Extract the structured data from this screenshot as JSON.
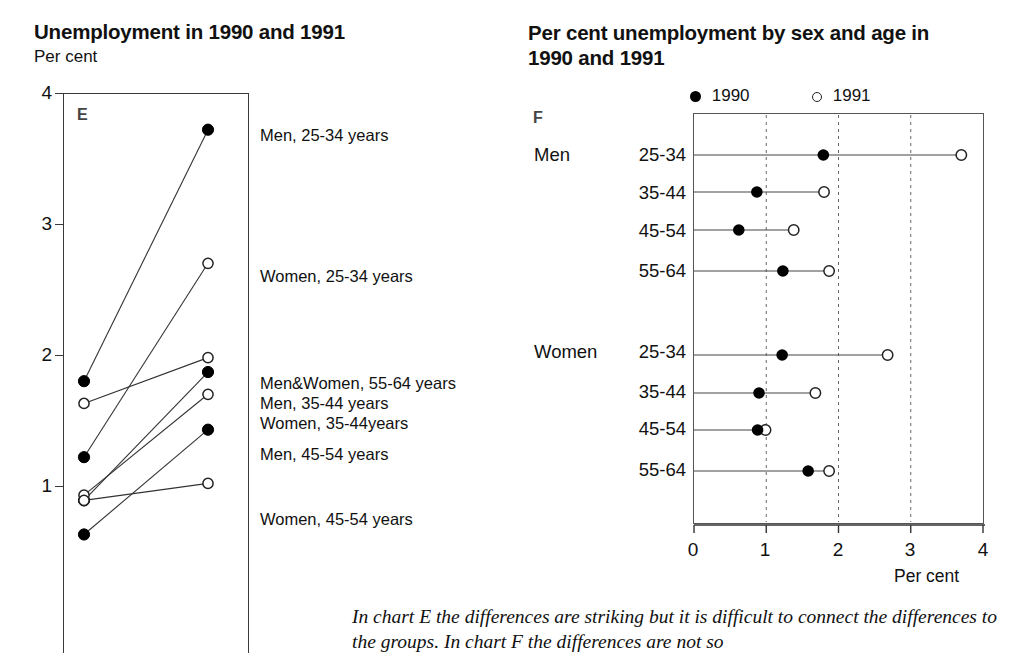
{
  "chart_e": {
    "title": "Unemployment in 1990 and 1991",
    "unit_label": "Per cent",
    "panel_letter": "E",
    "y_ticks": [
      "4",
      "3",
      "2",
      "1"
    ],
    "legend": [
      "Men, 25-34 years",
      "Women, 25-34 years",
      "Men&Women, 55-64 years",
      "Men, 35-44 years",
      "Women, 35-44years",
      "Men, 45-54 years",
      "Women, 45-54 years"
    ]
  },
  "chart_f": {
    "title": "Per cent unemployment by sex and age in 1990 and 1991",
    "panel_letter": "F",
    "legend": [
      {
        "marker": "filled-dot-icon",
        "label": "1990"
      },
      {
        "marker": "open-dot-icon",
        "label": "1991"
      }
    ],
    "group_labels": [
      "Men",
      "Women"
    ],
    "row_labels": [
      "25-34",
      "35-44",
      "45-54",
      "55-64",
      "25-34",
      "35-44",
      "45-54",
      "55-64"
    ],
    "x_ticks": [
      "0",
      "1",
      "2",
      "3",
      "4"
    ],
    "x_axis_title": "Per cent"
  },
  "caption": {
    "text": "In chart E the differences are striking but it is difficult to connect the differences to the groups. In chart F the differences are not so"
  },
  "colors": {
    "ink": "#111111",
    "axis": "#3a3a3a",
    "grid": "#7a7a7a",
    "marker_fill": "#000000",
    "marker_open": "#ffffff"
  },
  "chart_data": [
    {
      "type": "line",
      "id": "chart-e",
      "title": "Unemployment in 1990 and 1991",
      "xlabel": "",
      "ylabel": "Per cent",
      "ylim": [
        0,
        4
      ],
      "yticks": [
        1,
        2,
        3,
        4
      ],
      "grid": false,
      "legend_position": "right-labels",
      "x": [
        "1990",
        "1991"
      ],
      "series": [
        {
          "name": "Men, 25-34 years",
          "values": [
            1.8,
            3.72
          ]
        },
        {
          "name": "Women, 25-34 years",
          "values": [
            1.22,
            2.7
          ]
        },
        {
          "name": "Men&Women, 55-64 years",
          "values": [
            1.63,
            1.98
          ]
        },
        {
          "name": "Men, 35-44 years",
          "values": [
            0.89,
            1.87
          ]
        },
        {
          "name": "Women, 35-44years",
          "values": [
            0.93,
            1.7
          ]
        },
        {
          "name": "Men, 45-54 years",
          "values": [
            0.63,
            1.43
          ]
        },
        {
          "name": "Women, 45-54 years",
          "values": [
            0.89,
            1.02
          ]
        }
      ]
    },
    {
      "type": "scatter",
      "id": "chart-f",
      "title": "Per cent unemployment by sex and age in 1990 and 1991",
      "xlabel": "Per cent",
      "ylabel": "",
      "xlim": [
        0,
        4
      ],
      "xticks": [
        0,
        1,
        2,
        3,
        4
      ],
      "grid": true,
      "gridlines_x": [
        1,
        2,
        3
      ],
      "legend_position": "top",
      "categories": [
        "Men 25-34",
        "Men 35-44",
        "Men 45-54",
        "Men 55-64",
        "Women 25-34",
        "Women 35-44",
        "Women 45-54",
        "Women 55-64"
      ],
      "series": [
        {
          "name": "1990",
          "marker": "filled",
          "values": [
            1.79,
            0.87,
            0.62,
            1.23,
            1.22,
            0.9,
            0.88,
            1.58
          ]
        },
        {
          "name": "1991",
          "marker": "open",
          "values": [
            3.7,
            1.8,
            1.38,
            1.87,
            2.68,
            1.68,
            0.99,
            1.87
          ]
        }
      ]
    }
  ]
}
